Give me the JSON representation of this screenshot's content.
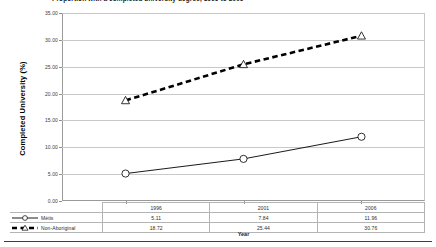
{
  "chart_data": {
    "type": "line",
    "title": "Proportion with a completed university degree, 1996 to 2006",
    "xlabel": "Year",
    "ylabel": "Completed University (%)",
    "categories": [
      "1996",
      "2001",
      "2006"
    ],
    "x": [
      1996,
      2001,
      2006
    ],
    "ylim": [
      0,
      35
    ],
    "ytick_values": [
      0,
      5,
      10,
      15,
      20,
      25,
      30,
      35
    ],
    "ytick_labels": [
      "0.00",
      "5.00",
      "10.00",
      "15.00",
      "20.00",
      "25.00",
      "30.00",
      "35.00"
    ],
    "grid": true,
    "legend_position": "bottom-table",
    "series": [
      {
        "name": "Métis",
        "values": [
          5.11,
          7.84,
          11.96
        ],
        "value_labels": [
          "5.11",
          "7.84",
          "11.96"
        ],
        "line_style": "solid",
        "marker": "circle",
        "color": "#000000"
      },
      {
        "name": "Non-Aboriginal",
        "values": [
          18.72,
          25.44,
          30.76
        ],
        "value_labels": [
          "18.72",
          "25.44",
          "30.76"
        ],
        "line_style": "dashed",
        "marker": "triangle",
        "color": "#000000"
      }
    ]
  },
  "table": {
    "corner_label": "",
    "column_headers": [
      "1996",
      "2001",
      "2006"
    ],
    "rows": [
      {
        "label": "Métis",
        "cells": [
          "5.11",
          "7.84",
          "11.96"
        ]
      },
      {
        "label": "Non-Aboriginal",
        "cells": [
          "18.72",
          "25.44",
          "30.76"
        ]
      }
    ]
  }
}
